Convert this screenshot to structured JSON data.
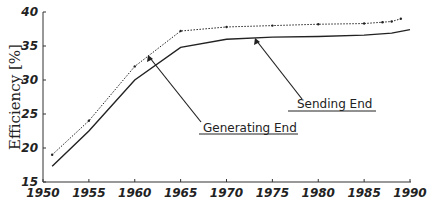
{
  "chart_data": {
    "type": "line",
    "title": "",
    "xlabel": "",
    "ylabel": "Efficiency [%]",
    "xlim": [
      1950,
      1990
    ],
    "ylim": [
      15,
      40
    ],
    "grid": false,
    "xticks": [
      "1950",
      "1955",
      "1960",
      "1965",
      "1970",
      "1975",
      "1980",
      "1985",
      "1990"
    ],
    "yticks": [
      "15",
      "20",
      "25",
      "30",
      "35",
      "40"
    ],
    "series": [
      {
        "name": "Sending End",
        "style": "dotted",
        "x": [
          1951,
          1955,
          1960,
          1965,
          1970,
          1975,
          1980,
          1985,
          1987,
          1988,
          1989
        ],
        "values": [
          19.0,
          24.0,
          32.0,
          37.2,
          37.8,
          38.0,
          38.2,
          38.3,
          38.5,
          38.6,
          39.0
        ]
      },
      {
        "name": "Generating End",
        "style": "solid",
        "x": [
          1951,
          1955,
          1960,
          1965,
          1970,
          1975,
          1980,
          1985,
          1988,
          1990
        ],
        "values": [
          17.3,
          22.5,
          30.0,
          34.8,
          36.0,
          36.3,
          36.4,
          36.6,
          36.9,
          37.4
        ]
      }
    ],
    "annotations": [
      {
        "text": "Sending End",
        "points_to": "Generating End line near 1970"
      },
      {
        "text": "Generating End",
        "points_to": "Sending End line near 1962"
      }
    ]
  },
  "labels": {
    "ylabel": "Efficiency [%]",
    "annot_sending": "Sending End",
    "annot_generating": "Generating End"
  }
}
